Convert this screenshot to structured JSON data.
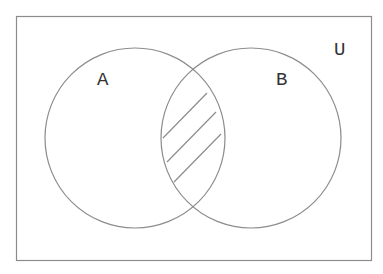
{
  "diagram": {
    "type": "venn",
    "universe_label": "U",
    "sets": [
      {
        "label": "A",
        "cx": 135,
        "cy": 138,
        "r": 90
      },
      {
        "label": "B",
        "cx": 251,
        "cy": 138,
        "r": 90
      }
    ],
    "shaded_region": "A ∩ B",
    "shading": "diagonal-hatch",
    "colors": {
      "stroke": "#8c8c8c",
      "text": "#333333",
      "background": "#ffffff"
    }
  }
}
